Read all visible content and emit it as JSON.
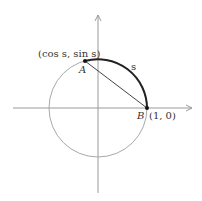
{
  "diagram": {
    "labels": {
      "point_a": "A",
      "point_a_coords": "(cos s, sin s)",
      "point_b": "B",
      "point_b_coords": "(1, 0)",
      "arc": "s"
    },
    "colors": {
      "axes": "#9a9a9a",
      "circle": "#a8a8a8",
      "arc": "#222222",
      "chord": "#444444",
      "text": "#333333"
    }
  }
}
